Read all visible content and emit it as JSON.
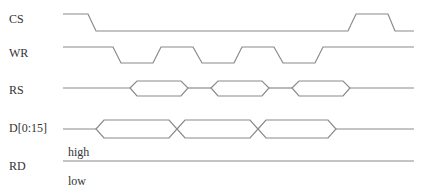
{
  "diagram": {
    "type": "timing-diagram",
    "signals": [
      {
        "name": "CS",
        "kind": "digital",
        "label_y": 13
      },
      {
        "name": "WR",
        "kind": "digital",
        "label_y": 47
      },
      {
        "name": "RS",
        "kind": "bus",
        "label_y": 84
      },
      {
        "name": "D[0:15]",
        "kind": "bus",
        "label_y": 122
      },
      {
        "name": "RD",
        "kind": "static",
        "label_y": 160
      }
    ],
    "rd_annotations": {
      "high": "high",
      "low": "low"
    },
    "line_color": "#8a8a8a",
    "text_color": "#333333"
  }
}
